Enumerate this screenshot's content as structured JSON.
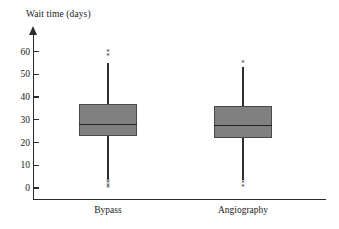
{
  "chart_data": {
    "type": "box",
    "title": "Wait time (days)",
    "xlabel": "",
    "ylabel": "Wait time (days)",
    "ylim": [
      0,
      63
    ],
    "yticks": [
      0,
      10,
      20,
      30,
      40,
      50,
      60
    ],
    "ytick_labels": [
      "0",
      "10",
      "20",
      "30",
      "40",
      "50",
      "60"
    ],
    "grid": false,
    "legend": null,
    "categories": [
      "Bypass",
      "Angiography"
    ],
    "boxes": [
      {
        "name": "Bypass",
        "whisker_low": 4,
        "q1": 23,
        "median": 28,
        "q3": 37,
        "whisker_high": 55,
        "outliers_high": [
          58,
          60
        ],
        "outliers_low": [
          0,
          1,
          2,
          3
        ]
      },
      {
        "name": "Angiography",
        "whisker_low": 3.5,
        "q1": 22,
        "median": 27.5,
        "q3": 36,
        "whisker_high": 53,
        "outliers_high": [
          55
        ],
        "outliers_low": [
          0.5,
          2
        ]
      }
    ],
    "colors": {
      "box_fill": "#808080",
      "box_edge": "#4a4a4a",
      "median": "#242424",
      "whisker": "#2f2f2f",
      "axis": "#2b2b2b",
      "text": "#1a1a1a",
      "background": "#ffffff"
    },
    "outlier_marker": "*"
  }
}
